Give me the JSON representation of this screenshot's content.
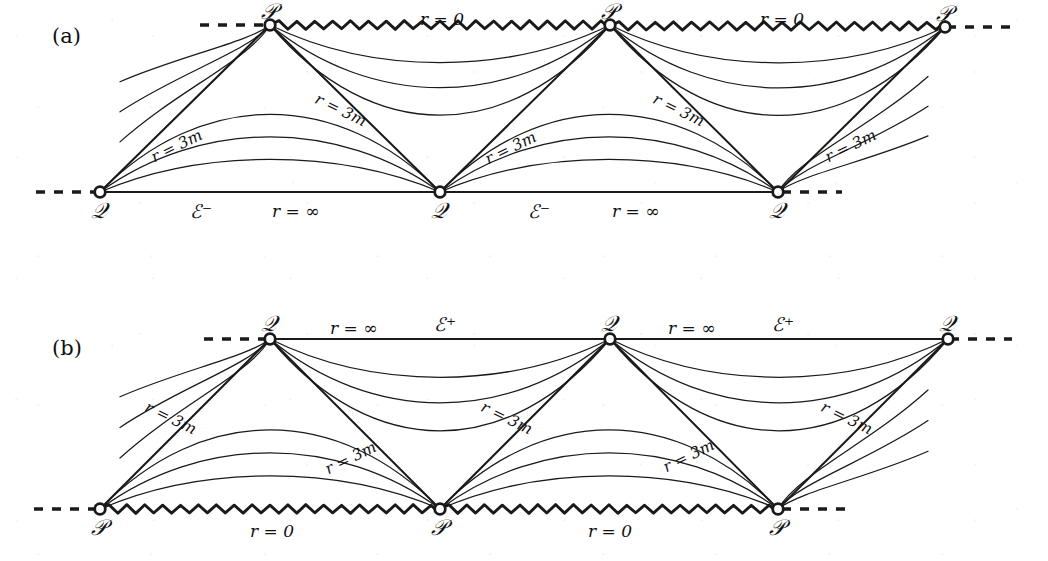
{
  "figure": {
    "kind": "conformal-penrose-diagram",
    "background_color": "#ffffff",
    "ink_color": "#1a1a1a",
    "width": 1048,
    "height": 561
  },
  "panels": [
    {
      "id": "a",
      "label": "(a)",
      "label_pos": {
        "x": 52,
        "y": 24
      },
      "description": "Schwarzschild conformal diagram, past-directed: singularity r = 0 along the top, past null infinity I^- along the bottom.",
      "top_boundary": {
        "type": "zigzag-singularity",
        "label": "r = 0",
        "y": 25
      },
      "bottom_boundary": {
        "type": "straight-null-infinity",
        "label": "r = ∞",
        "scri": "ℰ⁻",
        "y": 192
      },
      "apex_symbol": "𝒫",
      "base_symbol": "𝒬",
      "diagonal_label": "r = 3m",
      "top_vertices": [
        {
          "symbol": "𝒫",
          "x": 270,
          "y": 25
        },
        {
          "symbol": "𝒫",
          "x": 610,
          "y": 25
        },
        {
          "symbol": "𝒫",
          "x": 945,
          "y": 27
        }
      ],
      "bottom_vertices": [
        {
          "symbol": "𝒬",
          "x": 100,
          "y": 192
        },
        {
          "symbol": "𝒬",
          "x": 440,
          "y": 192
        },
        {
          "symbol": "𝒬",
          "x": 778,
          "y": 192
        }
      ],
      "zigzag_segments": [
        {
          "x1": 270,
          "x2": 610,
          "y": 25
        },
        {
          "x1": 610,
          "x2": 945,
          "y": 26
        }
      ],
      "dashes": [
        {
          "x1": 200,
          "x2": 268,
          "y": 25
        },
        {
          "x1": 947,
          "x2": 1010,
          "y": 27
        },
        {
          "x1": 36,
          "x2": 96,
          "y": 192
        },
        {
          "x1": 782,
          "x2": 842,
          "y": 192
        }
      ],
      "straight_edges": [
        {
          "x1": 100,
          "x2": 440,
          "y": 192
        },
        {
          "x1": 440,
          "x2": 778,
          "y": 192
        }
      ],
      "r0_labels": [
        {
          "text": "r = 0",
          "x": 420,
          "y": 9
        },
        {
          "text": "r = 0",
          "x": 760,
          "y": 9
        }
      ],
      "scri_labels": [
        {
          "text": "ℰ⁻",
          "x": 190,
          "y": 200
        },
        {
          "text": "ℰ⁻",
          "x": 528,
          "y": 200
        }
      ],
      "rinf_labels": [
        {
          "text": "r = ∞",
          "x": 272,
          "y": 201
        },
        {
          "text": "r = ∞",
          "x": 612,
          "y": 201
        }
      ],
      "diagonal_labels": [
        {
          "text": "r = 3m",
          "x": 148,
          "y": 150,
          "angle": -26
        },
        {
          "text": "r = 3m",
          "x": 320,
          "y": 90,
          "angle": 26
        },
        {
          "text": "r = 3m",
          "x": 482,
          "y": 152,
          "angle": -26
        },
        {
          "text": "r = 3m",
          "x": 658,
          "y": 90,
          "angle": 26
        },
        {
          "text": "r = 3m",
          "x": 822,
          "y": 150,
          "angle": -26
        }
      ]
    },
    {
      "id": "b",
      "label": "(b)",
      "label_pos": {
        "x": 52,
        "y": 336
      },
      "description": "Schwarzschild conformal diagram, future-directed: future null infinity I^+ along the top, singularity r = 0 along the bottom.",
      "top_boundary": {
        "type": "straight-null-infinity",
        "label": "r = ∞",
        "scri": "ℰ⁺",
        "y": 339
      },
      "bottom_boundary": {
        "type": "zigzag-singularity",
        "label": "r = 0",
        "y": 509
      },
      "apex_symbol": "𝒬",
      "base_symbol": "𝒫",
      "diagonal_label": "r = 3m",
      "top_vertices": [
        {
          "symbol": "𝒬",
          "x": 270,
          "y": 339
        },
        {
          "symbol": "𝒬",
          "x": 610,
          "y": 339
        },
        {
          "symbol": "𝒬",
          "x": 948,
          "y": 339
        }
      ],
      "bottom_vertices": [
        {
          "symbol": "𝒫",
          "x": 100,
          "y": 509
        },
        {
          "symbol": "𝒫",
          "x": 440,
          "y": 509
        },
        {
          "symbol": "𝒫",
          "x": 778,
          "y": 509
        }
      ],
      "zigzag_segments": [
        {
          "x1": 100,
          "x2": 440,
          "y": 509
        },
        {
          "x1": 440,
          "x2": 778,
          "y": 509
        }
      ],
      "dashes": [
        {
          "x1": 204,
          "x2": 268,
          "y": 339
        },
        {
          "x1": 950,
          "x2": 1012,
          "y": 339
        },
        {
          "x1": 34,
          "x2": 96,
          "y": 509
        },
        {
          "x1": 782,
          "x2": 846,
          "y": 509
        }
      ],
      "straight_edges": [
        {
          "x1": 270,
          "x2": 610,
          "y": 339
        },
        {
          "x1": 610,
          "x2": 948,
          "y": 339
        }
      ],
      "r0_labels": [
        {
          "text": "r = 0",
          "x": 250,
          "y": 521
        },
        {
          "text": "r = 0",
          "x": 588,
          "y": 521
        }
      ],
      "scri_labels": [
        {
          "text": "ℰ⁺",
          "x": 434,
          "y": 313
        },
        {
          "text": "ℰ⁺",
          "x": 772,
          "y": 313
        }
      ],
      "rinf_labels": [
        {
          "text": "r = ∞",
          "x": 330,
          "y": 318
        },
        {
          "text": "r = ∞",
          "x": 668,
          "y": 318
        }
      ],
      "diagonal_labels": [
        {
          "text": "r = 3m",
          "x": 150,
          "y": 398,
          "angle": 26
        },
        {
          "text": "r = 3m",
          "x": 322,
          "y": 462,
          "angle": -26
        },
        {
          "text": "r = 3m",
          "x": 486,
          "y": 398,
          "angle": 26
        },
        {
          "text": "r = 3m",
          "x": 660,
          "y": 460,
          "angle": -26
        },
        {
          "text": "r = 3m",
          "x": 826,
          "y": 398,
          "angle": 26
        }
      ]
    }
  ],
  "chart_data": {
    "type": "line",
    "title": "",
    "panels": [
      "(a)",
      "(b)"
    ],
    "series": [
      {
        "name": "exterior constant-r arches (panel a, between Q vertices)",
        "shape": "arch-up",
        "count_per_cell": 3,
        "endpoints": "Q to Q on the r = ∞ line",
        "peak_heights_px": [
          96,
          126,
          152
        ]
      },
      {
        "name": "interior constant-r sags (panel a, between P vertices)",
        "shape": "sag-down",
        "count_per_cell": 3,
        "endpoints": "P to P on the r = 0 zigzag",
        "trough_depths_px": [
          72,
          102,
          128
        ]
      },
      {
        "name": "exterior constant-r arches (panel b, between P vertices)",
        "shape": "arch-up",
        "count_per_cell": 3,
        "endpoints": "P to P on the r = 0 zigzag",
        "peak_heights_px": [
          413,
          443,
          469
        ]
      },
      {
        "name": "interior constant-r sags (panel b, between Q vertices)",
        "shape": "sag-down",
        "count_per_cell": 3,
        "endpoints": "Q to Q on the r = ∞ line",
        "trough_depths_px": [
          386,
          416,
          442
        ]
      }
    ],
    "annotations": [
      "r = 0",
      "r = ∞",
      "r = 3m",
      "ℰ⁻",
      "ℰ⁺",
      "𝒫",
      "𝒬"
    ],
    "grid": false,
    "legend": "none"
  },
  "glyphs": {
    "script_p": "𝒫",
    "script_q": "𝒬",
    "scri_minus": "ℰ⁻",
    "scri_plus": "ℰ⁺",
    "infinity": "∞"
  }
}
